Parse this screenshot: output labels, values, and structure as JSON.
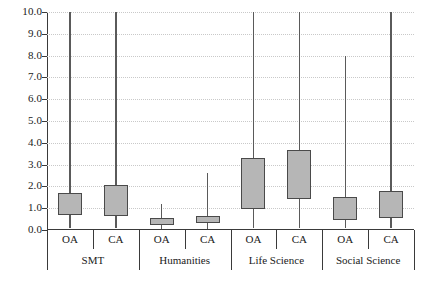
{
  "chart_data": {
    "type": "box",
    "title": "",
    "xlabel": "",
    "ylabel": "",
    "ylim": [
      0.0,
      10.0
    ],
    "grid": true,
    "legend": "none",
    "y_ticks": [
      "0.0",
      "1.0",
      "2.0",
      "3.0",
      "4.0",
      "5.0",
      "6.0",
      "7.0",
      "8.0",
      "9.0",
      "10.0"
    ],
    "y_tick_values": [
      0.0,
      1.0,
      2.0,
      3.0,
      4.0,
      5.0,
      6.0,
      7.0,
      8.0,
      9.0,
      10.0
    ],
    "groups": [
      {
        "label": "SMT",
        "boxes": [
          {
            "label": "OA",
            "whisker_low": 0.1,
            "q1": 0.7,
            "q3": 1.7,
            "whisker_high": 10.0
          },
          {
            "label": "CA",
            "whisker_low": 0.1,
            "q1": 0.65,
            "q3": 2.05,
            "whisker_high": 10.0
          }
        ]
      },
      {
        "label": "Humanities",
        "boxes": [
          {
            "label": "OA",
            "whisker_low": 0.05,
            "q1": 0.25,
            "q3": 0.55,
            "whisker_high": 1.2
          },
          {
            "label": "CA",
            "whisker_low": 0.05,
            "q1": 0.3,
            "q3": 0.65,
            "whisker_high": 2.6
          }
        ]
      },
      {
        "label": "Life Science",
        "boxes": [
          {
            "label": "OA",
            "whisker_low": 0.1,
            "q1": 0.95,
            "q3": 3.3,
            "whisker_high": 10.0
          },
          {
            "label": "CA",
            "whisker_low": 0.1,
            "q1": 1.4,
            "q3": 3.65,
            "whisker_high": 10.0
          }
        ]
      },
      {
        "label": "Social Science",
        "boxes": [
          {
            "label": "OA",
            "whisker_low": 0.1,
            "q1": 0.45,
            "q3": 1.5,
            "whisker_high": 8.0
          },
          {
            "label": "CA",
            "whisker_low": 0.1,
            "q1": 0.55,
            "q3": 1.8,
            "whisker_high": 10.0
          }
        ]
      }
    ],
    "colors": {
      "box_fill": "#b6b6b6",
      "box_border": "#4a4a4a",
      "whisker": "#5a5a5a",
      "grid": "#c9c9c9",
      "axis": "#3a3a3a",
      "text": "#1a1a1a",
      "background": "#ffffff"
    }
  }
}
